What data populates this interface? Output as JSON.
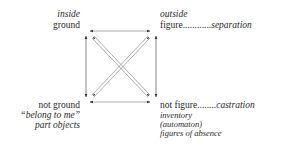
{
  "diagram": {
    "top_left": {
      "line1": "inside",
      "line2": "ground"
    },
    "top_right": {
      "line1": "outside",
      "line2_term": "figure",
      "line2_dots": "............",
      "line2_result": "separation"
    },
    "bottom_left": {
      "line1": "not ground",
      "line2": "“belong to me”",
      "line3": "part objects"
    },
    "bottom_right": {
      "line1_term": "not figure",
      "line1_dots": "........",
      "line1_result": "castration",
      "line2": "inventory",
      "line3": "(automaton)",
      "line4": "figures of absence"
    },
    "colors": {
      "text": "#2a2a2a",
      "lines": "#555555"
    }
  }
}
